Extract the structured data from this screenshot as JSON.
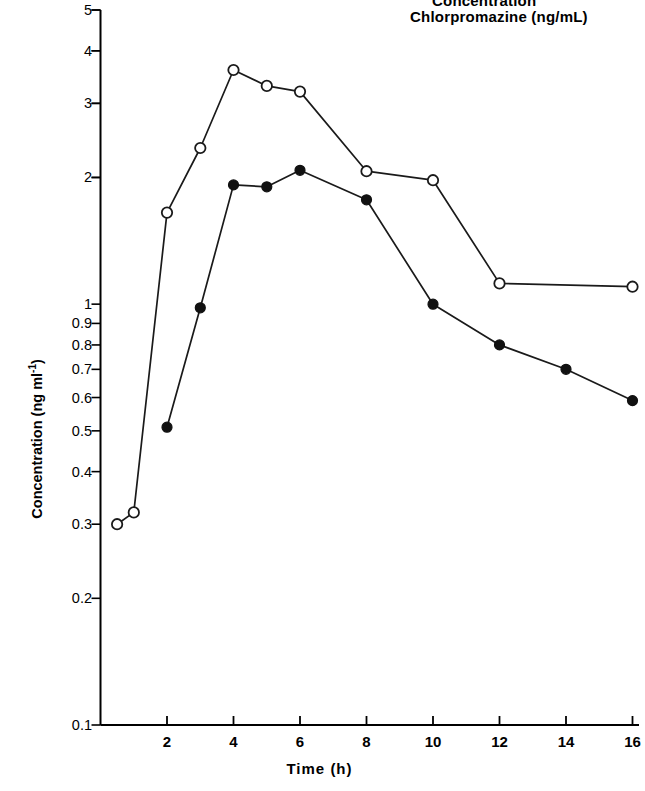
{
  "title": {
    "line1": "Concentration",
    "line2": "Chlorpromazine  (ng/mL)"
  },
  "axes": {
    "xlabel": "Time (h)",
    "ylabel_text": "Concentration (ng ml",
    "ylabel_sup": "-1",
    "ylabel_close": ")",
    "xticks": [
      "2",
      "4",
      "6",
      "8",
      "10",
      "12",
      "14",
      "16"
    ],
    "yticks": [
      "5",
      "4",
      "3",
      "2",
      "1",
      "0.9",
      "0.8",
      "0.7",
      "0.6",
      "0.5",
      "0.4",
      "0.3",
      "0.2",
      "0.1"
    ]
  },
  "colors": {
    "axis": "#000000",
    "line": "#1a1a1a",
    "open_marker_fill": "#ffffff",
    "filled_marker_fill": "#111111"
  },
  "chart_data": {
    "type": "line",
    "title": "Concentration Chlorpromazine (ng/mL)",
    "xlabel": "Time (h)",
    "ylabel": "Concentration (ng ml^-1)",
    "yscale": "log",
    "xlim": [
      0,
      16.3
    ],
    "ylim": [
      0.1,
      5
    ],
    "grid": false,
    "legend": "none",
    "xticks": [
      2,
      4,
      6,
      8,
      10,
      12,
      14,
      16
    ],
    "yticks": [
      5,
      4,
      3,
      2,
      1,
      0.9,
      0.8,
      0.7,
      0.6,
      0.5,
      0.4,
      0.3,
      0.2,
      0.1
    ],
    "series": [
      {
        "name": "open-circles",
        "marker": "open-circle",
        "x": [
          0.5,
          1.0,
          2.0,
          3.0,
          4.0,
          5.0,
          6.0,
          8.0,
          10.0,
          12.0,
          16.0
        ],
        "values": [
          0.3,
          0.32,
          1.65,
          2.35,
          3.6,
          3.3,
          3.2,
          2.07,
          1.97,
          1.12,
          1.1
        ]
      },
      {
        "name": "filled-circles",
        "marker": "filled-circle",
        "x": [
          2.0,
          3.0,
          4.0,
          5.0,
          6.0,
          8.0,
          10.0,
          12.0,
          14.0,
          16.0
        ],
        "values": [
          0.51,
          0.98,
          1.92,
          1.9,
          2.08,
          1.77,
          1.0,
          0.8,
          0.7,
          0.59
        ]
      }
    ]
  }
}
